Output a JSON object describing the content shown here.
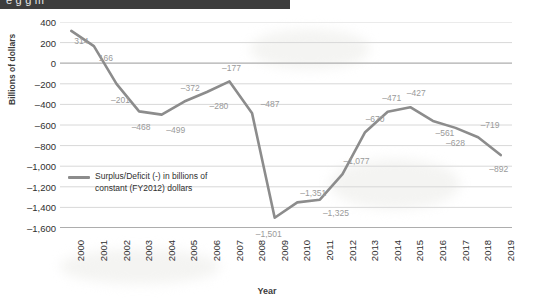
{
  "window": {
    "header_text": "e  g   g    m"
  },
  "chart_data": {
    "type": "line",
    "title": "",
    "xlabel": "Year",
    "ylabel": "Billions of dollars",
    "ylim": [
      -1600,
      400
    ],
    "yticks": [
      "400",
      "200",
      "0",
      "-200",
      "-400",
      "-600",
      "-800",
      "-1,000",
      "-1,200",
      "-1,400",
      "-1,600"
    ],
    "ytick_values": [
      400,
      200,
      0,
      -200,
      -400,
      -600,
      -800,
      -1000,
      -1200,
      -1400,
      -1600
    ],
    "grid": true,
    "legend_position": "inside-left",
    "categories": [
      "2000",
      "2001",
      "2002",
      "2003",
      "2004",
      "2005",
      "2006",
      "2007",
      "2008",
      "2009",
      "2010",
      "2011",
      "2012",
      "2013",
      "2014",
      "2015",
      "2016",
      "2017",
      "2018",
      "2019"
    ],
    "series": [
      {
        "name": "Surplus/Deficit (-) in billions of constant (FY2012) dollars",
        "color": "#8c8c8c",
        "values": [
          314,
          166,
          -201,
          -468,
          -499,
          -372,
          -280,
          -177,
          -487,
          -1501,
          -1351,
          -1325,
          -1077,
          -670,
          -471,
          -427,
          -561,
          -628,
          -719,
          -892
        ],
        "point_labels": [
          "314",
          "166",
          "-201",
          "-468",
          "-499",
          "-372",
          "-280",
          "-177",
          "-487",
          "-1,501",
          "-1,351",
          "-1,325",
          "-1,077",
          "-670",
          "-471",
          "-427",
          "-561",
          "-628",
          "-719",
          "-892"
        ]
      }
    ]
  },
  "legend": {
    "line1": "Surplus/Deficit (-) in billions of",
    "line2": "constant (FY2012) dollars"
  }
}
